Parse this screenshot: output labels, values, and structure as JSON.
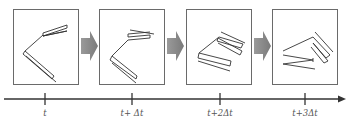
{
  "diagram": {
    "frames": [
      {
        "id": "frame-t0",
        "label": "t"
      },
      {
        "id": "frame-t1",
        "label": "t+ Δt"
      },
      {
        "id": "frame-t2",
        "label": "t+2Δt"
      },
      {
        "id": "frame-t3",
        "label": "t+3Δt"
      }
    ],
    "timeline": {
      "ticks": [
        "t",
        "t+ Δt",
        "t+2Δt",
        "t+3Δt"
      ]
    },
    "colors": {
      "frame_border": "#6a6a6a",
      "shape_stroke": "#333333",
      "arrow_fill": "#8c8c8c",
      "timeline": "#333333"
    }
  }
}
